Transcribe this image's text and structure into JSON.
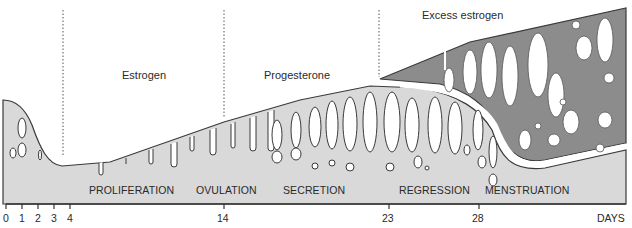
{
  "diagram": {
    "hormones": [
      {
        "label": "Estrogen",
        "x": 130,
        "y": 69
      },
      {
        "label": "Progesterone",
        "x": 292,
        "y": 69
      },
      {
        "label": "Excess estrogen",
        "x": 422,
        "y": 9
      }
    ],
    "phases": [
      {
        "label": "PROLIFERATION",
        "x": 89
      },
      {
        "label": "OVULATION",
        "x": 196
      },
      {
        "label": "SECRETION",
        "x": 283
      },
      {
        "label": "REGRESSION",
        "x": 399
      },
      {
        "label": "MENSTRUATION",
        "x": 485
      }
    ],
    "axis": {
      "unit_label": "DAYS",
      "ticks": [
        {
          "label": "0",
          "x": 6
        },
        {
          "label": "1",
          "x": 22
        },
        {
          "label": "2",
          "x": 38
        },
        {
          "label": "3",
          "x": 54
        },
        {
          "label": "4",
          "x": 70
        },
        {
          "label": "14",
          "x": 224
        },
        {
          "label": "23",
          "x": 389
        },
        {
          "label": "28",
          "x": 479
        }
      ]
    },
    "markers": [
      {
        "name": "day-4-divider",
        "x": 63
      },
      {
        "name": "day-14-divider",
        "x": 224
      },
      {
        "name": "day-23-divider",
        "x": 379
      }
    ],
    "colors": {
      "light_tissue": "#d9d9d9",
      "dark_tissue": "#8c8c8c",
      "outline": "#3a3a3a",
      "gland": "#ffffff"
    }
  }
}
